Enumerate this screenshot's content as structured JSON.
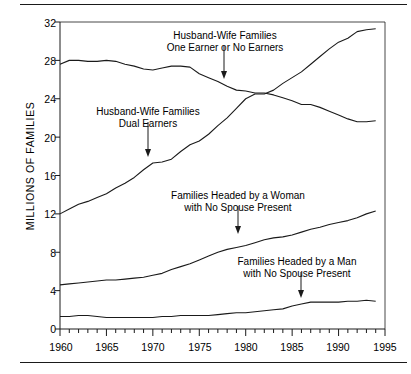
{
  "figure": {
    "has_top_rule": true,
    "has_bottom_rule": true,
    "background_color": "#ffffff",
    "line_color": "#1a1a1a"
  },
  "axis": {
    "ylabel": "MILLIONS OF FAMILIES",
    "ytick_labels": [
      "32",
      "28",
      "24",
      "20",
      "16",
      "12",
      "8",
      "4",
      "0"
    ],
    "xtick_labels": [
      "1960",
      "1965",
      "1970",
      "1975",
      "1980",
      "1985",
      "1990",
      "1995"
    ]
  },
  "annotations": [
    {
      "name": "annot-one-earner",
      "line1": "Husband-Wife Families",
      "line2": "One Earner or No Earners"
    },
    {
      "name": "annot-dual-earners",
      "line1": "Husband-Wife Families",
      "line2": "Dual Earners"
    },
    {
      "name": "annot-woman-headed",
      "line1": "Families Headed by a Woman",
      "line2": "with No Spouse Present"
    },
    {
      "name": "annot-man-headed",
      "line1": "Families Headed by a Man",
      "line2": "with No Spouse Present"
    }
  ],
  "chart_data": {
    "type": "line",
    "title": "",
    "xlabel": "",
    "ylabel": "MILLIONS OF FAMILIES",
    "xlim": [
      1960,
      1995
    ],
    "ylim": [
      0,
      32
    ],
    "ytick_values": [
      0,
      4,
      8,
      12,
      16,
      20,
      24,
      28,
      32
    ],
    "xtick_values": [
      1960,
      1965,
      1970,
      1975,
      1980,
      1985,
      1990,
      1995
    ],
    "minor_xticks_every": 1,
    "grid": false,
    "legend": "annotations-with-arrows",
    "x": [
      1960,
      1961,
      1962,
      1963,
      1964,
      1965,
      1966,
      1967,
      1968,
      1969,
      1970,
      1971,
      1972,
      1973,
      1974,
      1975,
      1976,
      1977,
      1978,
      1979,
      1980,
      1981,
      1982,
      1983,
      1984,
      1985,
      1986,
      1987,
      1988,
      1989,
      1990,
      1991,
      1992,
      1993,
      1994
    ],
    "series": [
      {
        "name": "Husband-Wife Families, One Earner or No Earners",
        "values": [
          27.6,
          28.0,
          28.0,
          27.9,
          27.9,
          28.0,
          27.9,
          27.6,
          27.4,
          27.1,
          27.0,
          27.2,
          27.4,
          27.4,
          27.3,
          26.6,
          26.2,
          25.8,
          25.3,
          24.9,
          24.8,
          24.6,
          24.6,
          24.4,
          24.1,
          23.8,
          23.4,
          23.4,
          23.1,
          22.7,
          22.3,
          21.9,
          21.6,
          21.6,
          21.7
        ]
      },
      {
        "name": "Husband-Wife Families, Dual Earners",
        "values": [
          12.0,
          12.5,
          13.0,
          13.3,
          13.7,
          14.1,
          14.7,
          15.2,
          15.8,
          16.6,
          17.3,
          17.4,
          17.7,
          18.5,
          19.2,
          19.6,
          20.3,
          21.2,
          22.0,
          23.0,
          24.0,
          24.5,
          24.5,
          24.9,
          25.6,
          26.2,
          26.8,
          27.6,
          28.4,
          29.2,
          29.9,
          30.3,
          31.0,
          31.2,
          31.3
        ]
      },
      {
        "name": "Families Headed by a Woman with No Spouse Present",
        "values": [
          4.6,
          4.7,
          4.8,
          4.9,
          5.0,
          5.1,
          5.1,
          5.2,
          5.3,
          5.4,
          5.6,
          5.8,
          6.2,
          6.5,
          6.8,
          7.2,
          7.6,
          8.0,
          8.3,
          8.5,
          8.7,
          9.0,
          9.3,
          9.5,
          9.6,
          9.8,
          10.1,
          10.4,
          10.6,
          10.9,
          11.1,
          11.3,
          11.6,
          12.0,
          12.3
        ]
      },
      {
        "name": "Families Headed by a Man with No Spouse Present",
        "values": [
          1.3,
          1.3,
          1.4,
          1.4,
          1.3,
          1.2,
          1.2,
          1.2,
          1.2,
          1.2,
          1.2,
          1.3,
          1.3,
          1.4,
          1.4,
          1.4,
          1.4,
          1.5,
          1.6,
          1.7,
          1.7,
          1.8,
          1.9,
          2.0,
          2.1,
          2.4,
          2.6,
          2.8,
          2.8,
          2.8,
          2.8,
          2.9,
          2.9,
          3.0,
          2.9
        ]
      }
    ]
  }
}
